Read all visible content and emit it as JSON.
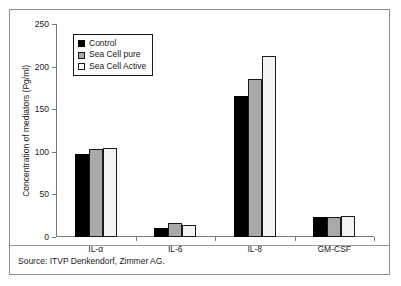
{
  "chart_data": {
    "type": "bar",
    "title": "",
    "xlabel": "",
    "ylabel": "Concentration of mediators (Pg/ml)",
    "categories": [
      "IL-α",
      "IL-6",
      "IL-8",
      "GM-CSF"
    ],
    "series": [
      {
        "name": "Control",
        "color": "#000000",
        "values": [
          97,
          11,
          165,
          23
        ]
      },
      {
        "name": "Sea Cell pure",
        "color": "#a9a9a9",
        "values": [
          103,
          16,
          185,
          23
        ]
      },
      {
        "name": "Sea Cell Active",
        "color": "#f3f3f3",
        "values": [
          105,
          14,
          213,
          25
        ]
      }
    ],
    "ylim": [
      0,
      250
    ],
    "yticks": [
      0,
      50,
      100,
      150,
      200,
      250
    ],
    "ytick_labels": [
      "0",
      "50",
      "100",
      "150",
      "200",
      "250"
    ],
    "grid": false,
    "legend_position": "top-left"
  },
  "legend": {
    "items": [
      {
        "label": "Control"
      },
      {
        "label": "Sea Cell pure"
      },
      {
        "label": "Sea Cell Active"
      }
    ]
  },
  "source": {
    "text": "Source: ITVP Denkendorf, Zimmer AG."
  }
}
